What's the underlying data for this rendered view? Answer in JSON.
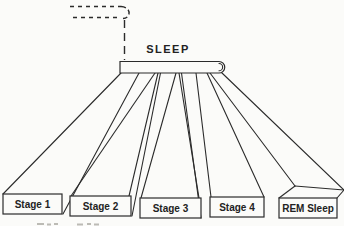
{
  "figure": {
    "bar_label": "SLEEP",
    "stages": [
      {
        "label": "Stage 1"
      },
      {
        "label": "Stage 2"
      },
      {
        "label": "Stage 3"
      },
      {
        "label": "Stage 4"
      },
      {
        "label": "REM Sleep"
      }
    ],
    "colors": {
      "ink": "#2b2b2b",
      "paper": "#fbfbf9"
    }
  }
}
